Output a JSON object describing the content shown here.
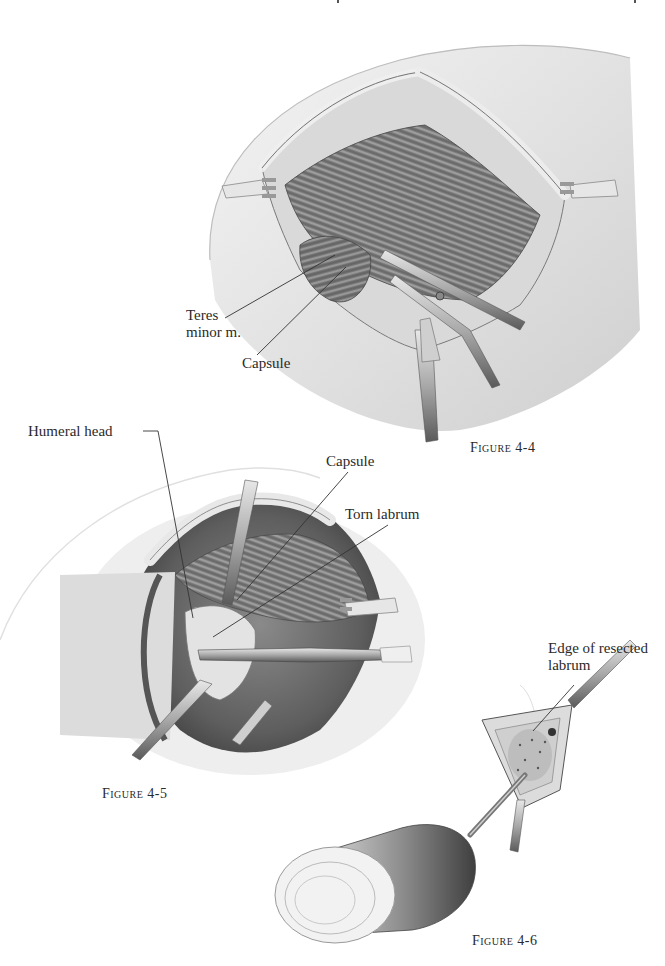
{
  "figures": [
    {
      "id": "fig-4-4",
      "caption": "Figure 4-4",
      "labels": [
        {
          "key": "teres",
          "line1": "Teres",
          "line2": "minor m."
        },
        {
          "key": "capsule",
          "text": "Capsule"
        }
      ]
    },
    {
      "id": "fig-4-5",
      "caption": "Figure 4-5",
      "labels": [
        {
          "key": "humeral_head",
          "text": "Humeral head"
        },
        {
          "key": "capsule",
          "text": "Capsule"
        },
        {
          "key": "torn_labrum",
          "text": "Torn labrum"
        }
      ]
    },
    {
      "id": "fig-4-6",
      "caption": "Figure 4-6",
      "labels": [
        {
          "key": "edge",
          "line1": "Edge of resected",
          "line2": "labrum"
        }
      ]
    }
  ],
  "colors": {
    "ink": "#2a2a2a",
    "skin_light": "#efefef",
    "skin_mid": "#d4d4d4",
    "muscle_dark": "#6a6a6a",
    "instrument": "#b8b8b8"
  }
}
